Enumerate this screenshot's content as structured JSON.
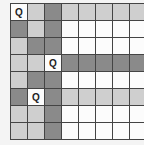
{
  "game": {
    "type": "queens-puzzle",
    "rows": 8,
    "cols": 8,
    "queen_symbol": "Q",
    "colors": {
      "w": "#fcfcfc",
      "l": "#cfcfcf",
      "d": "#8a8a8a"
    },
    "grid": [
      [
        "w",
        "l",
        "d",
        "l",
        "l",
        "l",
        "l",
        "l"
      ],
      [
        "d",
        "l",
        "d",
        "w",
        "w",
        "w",
        "w",
        "w"
      ],
      [
        "l",
        "d",
        "d",
        "w",
        "w",
        "w",
        "w",
        "w"
      ],
      [
        "l",
        "l",
        "w",
        "d",
        "d",
        "d",
        "d",
        "d"
      ],
      [
        "l",
        "d",
        "d",
        "w",
        "w",
        "w",
        "w",
        "w"
      ],
      [
        "d",
        "w",
        "d",
        "l",
        "l",
        "l",
        "l",
        "l"
      ],
      [
        "l",
        "l",
        "d",
        "w",
        "w",
        "w",
        "w",
        "w"
      ],
      [
        "l",
        "l",
        "d",
        "w",
        "w",
        "w",
        "w",
        "w"
      ]
    ],
    "queens": [
      {
        "row": 0,
        "col": 0
      },
      {
        "row": 3,
        "col": 2
      },
      {
        "row": 5,
        "col": 1
      }
    ]
  }
}
